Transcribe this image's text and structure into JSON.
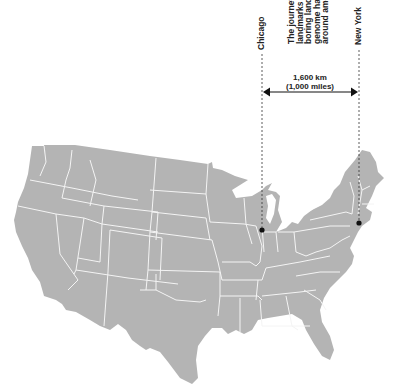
{
  "figure": {
    "cities": [
      {
        "name": "Chicago",
        "dot_x": 262,
        "dot_y": 230
      },
      {
        "name": "New York",
        "dot_x": 359,
        "dot_y": 223
      }
    ],
    "distance": {
      "km_label": "1,600 km",
      "miles_label": "(1,000 miles)"
    },
    "caption_lines": [
      "The journey t",
      "landmarks a",
      "boring lands",
      "genome has",
      "around amo"
    ],
    "colors": {
      "land": "#b4b4b4",
      "borders": "#f4f4f4",
      "ink": "#111111",
      "background": "#ffffff"
    }
  }
}
